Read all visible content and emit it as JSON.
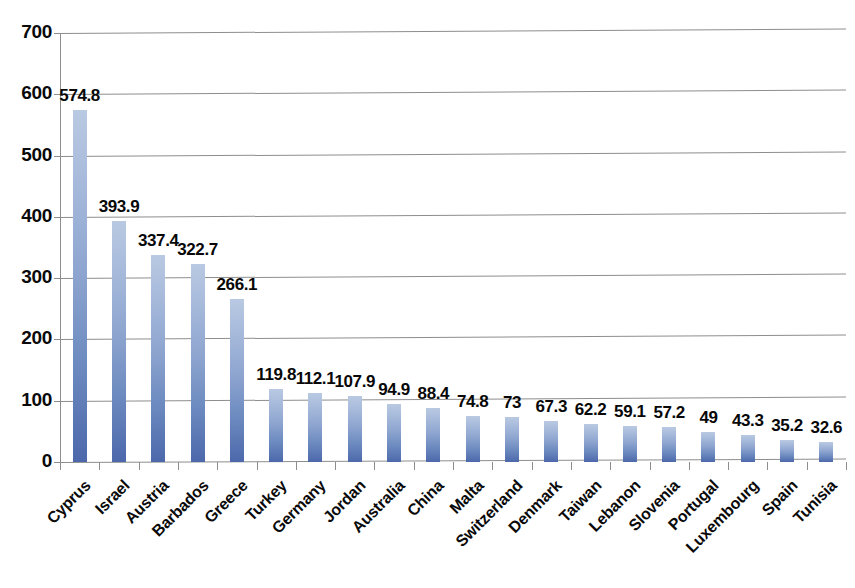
{
  "chart_data": {
    "type": "bar",
    "title": "",
    "subtitle": "",
    "xlabel": "",
    "ylabel": "",
    "ylim": [
      0,
      700
    ],
    "ytick_step": 100,
    "yticks": [
      "0",
      "100",
      "200",
      "300",
      "400",
      "500",
      "600",
      "700"
    ],
    "grid": true,
    "legend": false,
    "legend_position": "none",
    "bar_color_top": "#b9c9e2",
    "bar_color_bottom": "#4c68ab",
    "gridline_color": "#8e8e8e",
    "label_color": "#080808",
    "categories": [
      "Cyprus",
      "Israel",
      "Austria",
      "Barbados",
      "Greece",
      "Turkey",
      "Germany",
      "Jordan",
      "Australia",
      "China",
      "Malta",
      "Switzerland",
      "Denmark",
      "Taiwan",
      "Lebanon",
      "Slovenia",
      "Portugal",
      "Luxembourg",
      "Spain",
      "Tunisia"
    ],
    "values": [
      574.8,
      393.9,
      337.4,
      322.7,
      266.1,
      119.8,
      112.1,
      107.9,
      94.9,
      88.4,
      74.8,
      73,
      67.3,
      62.2,
      59.1,
      57.2,
      49,
      43.3,
      35.2,
      32.6
    ],
    "value_labels": [
      "574.8",
      "393.9",
      "337.4",
      "322.7",
      "266.1",
      "119.8",
      "112.1",
      "107.9",
      "94.9",
      "88.4",
      "74.8",
      "73",
      "67.3",
      "62.2",
      "59.1",
      "57.2",
      "49",
      "43.3",
      "35.2",
      "32.6"
    ]
  }
}
